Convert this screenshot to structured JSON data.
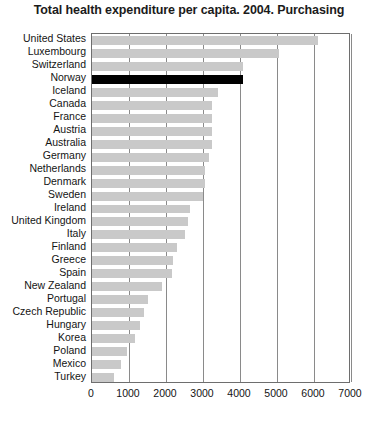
{
  "chart_data": {
    "type": "bar",
    "orientation": "horizontal",
    "title": "Total health expenditure per capita. 2004. Purchasing",
    "xlabel": "",
    "ylabel": "",
    "xlim": [
      0,
      7000
    ],
    "xticks": [
      0,
      1000,
      2000,
      3000,
      4000,
      5000,
      6000,
      7000
    ],
    "xtick_labels": [
      "0",
      "1000",
      "2000",
      "3000",
      "4000",
      "5000",
      "6000",
      "7000"
    ],
    "grid": true,
    "grid_axis": "x",
    "legend": false,
    "bar_color": "#c9c9c9",
    "highlight_color": "#000000",
    "highlight_category": "Norway",
    "categories": [
      "United States",
      "Luxembourg",
      "Switzerland",
      "Norway",
      "Iceland",
      "Canada",
      "France",
      "Austria",
      "Australia",
      "Germany",
      "Netherlands",
      "Denmark",
      "Sweden",
      "Ireland",
      "United Kingdom",
      "Italy",
      "Finland",
      "Greece",
      "Spain",
      "New Zealand",
      "Portugal",
      "Czech Republic",
      "Hungary",
      "Korea",
      "Poland",
      "Mexico",
      "Turkey"
    ],
    "values": [
      6100,
      5050,
      4080,
      4080,
      3400,
      3250,
      3250,
      3250,
      3250,
      3150,
      3050,
      3050,
      3000,
      2650,
      2600,
      2520,
      2300,
      2200,
      2150,
      1900,
      1500,
      1400,
      1300,
      1150,
      950,
      790,
      600
    ]
  }
}
